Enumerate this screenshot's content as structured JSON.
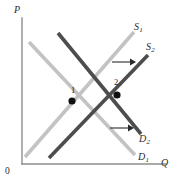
{
  "figure": {
    "kind": "supply-demand-shift-diagram",
    "background_color": "#ffffff",
    "axes": {
      "y_label": "P",
      "x_label": "Q",
      "origin_label": "0",
      "axis_color": "#8e8e8e"
    },
    "curves": [
      {
        "id": "S1",
        "label": "S",
        "subscript": "1",
        "role": "supply-original",
        "color": "#c3c3c3",
        "shade": "light",
        "slope": "upward",
        "from": [
          25,
          157
        ],
        "to": [
          134,
          32
        ]
      },
      {
        "id": "S2",
        "label": "S",
        "subscript": "2",
        "role": "supply-shifted",
        "color": "#4d4d4d",
        "shade": "dark",
        "slope": "upward",
        "from": [
          49,
          158
        ],
        "to": [
          148,
          55
        ]
      },
      {
        "id": "D1",
        "label": "D",
        "subscript": "1",
        "role": "demand-original",
        "color": "#c3c3c3",
        "shade": "light",
        "slope": "downward",
        "from": [
          29,
          42
        ],
        "to": [
          135,
          155
        ]
      },
      {
        "id": "D2",
        "label": "D",
        "subscript": "2",
        "role": "demand-shifted",
        "color": "#4d4d4d",
        "shade": "dark",
        "slope": "downward",
        "from": [
          58,
          33
        ],
        "to": [
          141,
          134
        ]
      }
    ],
    "equilibria": [
      {
        "id": "point-1",
        "label": "1",
        "x": 72,
        "y": 101,
        "description": "initial equilibrium where S1 crosses D1"
      },
      {
        "id": "point-2",
        "label": "2",
        "x": 117,
        "y": 95,
        "description": "new equilibrium where S2 crosses D2"
      }
    ],
    "shift_arrows": [
      {
        "id": "supply-shift-arrow",
        "direction": "right",
        "from": [
          112,
          62
        ],
        "to": [
          134,
          62
        ],
        "meaning": "supply curve shifts right"
      },
      {
        "id": "demand-shift-arrow",
        "direction": "right",
        "from": [
          110,
          128
        ],
        "to": [
          132,
          128
        ],
        "meaning": "demand curve shifts right"
      }
    ]
  },
  "labels": {
    "y_axis": "P",
    "x_axis": "Q",
    "origin": "0",
    "s1_base": "S",
    "s1_sub": "1",
    "s2_base": "S",
    "s2_sub": "2",
    "d1_base": "D",
    "d1_sub": "1",
    "d2_base": "D",
    "d2_sub": "2",
    "point1": "1",
    "point2": "2"
  }
}
